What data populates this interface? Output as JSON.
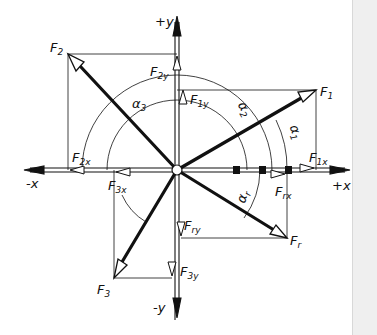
{
  "diagram": {
    "colors": {
      "ink": "#111111",
      "background": "#ffffff",
      "edge_strip": "#efefef"
    },
    "axes": {
      "plus_y": "+y",
      "minus_y": "-y",
      "plus_x": "+x",
      "minus_x": "-x"
    },
    "forces": [
      {
        "name": "F",
        "sub": "1",
        "label": "F1"
      },
      {
        "name": "F",
        "sub": "2",
        "label": "F2"
      },
      {
        "name": "F",
        "sub": "3",
        "label": "F3"
      },
      {
        "name": "F",
        "sub": "r",
        "label": "Fr"
      }
    ],
    "components": [
      {
        "name": "F",
        "sub": "1x",
        "label": "F1x"
      },
      {
        "name": "F",
        "sub": "1y",
        "label": "F1y"
      },
      {
        "name": "F",
        "sub": "2x",
        "label": "F2x"
      },
      {
        "name": "F",
        "sub": "2y",
        "label": "F2y"
      },
      {
        "name": "F",
        "sub": "3x",
        "label": "F3x"
      },
      {
        "name": "F",
        "sub": "3y",
        "label": "F3y"
      },
      {
        "name": "F",
        "sub": "rx",
        "label": "Frx"
      },
      {
        "name": "F",
        "sub": "ry",
        "label": "Fry"
      }
    ],
    "angles": [
      {
        "name": "α",
        "sub": "1",
        "label": "α1"
      },
      {
        "name": "α",
        "sub": "2",
        "label": "α2"
      },
      {
        "name": "α",
        "sub": "3",
        "label": "α3"
      },
      {
        "name": "α",
        "sub": "r",
        "label": "αr"
      }
    ]
  }
}
